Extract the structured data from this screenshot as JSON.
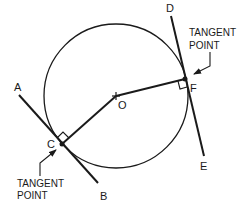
{
  "diagram": {
    "colors": {
      "stroke": "#1a1a1a",
      "background": "#ffffff"
    },
    "circle": {
      "center_label": "O",
      "cx": 116,
      "cy": 96,
      "r": 72
    },
    "points": {
      "O": {
        "label": "O",
        "x": 116,
        "y": 96
      },
      "C": {
        "label": "C",
        "x": 62,
        "y": 144
      },
      "F": {
        "label": "F",
        "x": 185,
        "y": 79
      }
    },
    "lines": {
      "AB": {
        "start_label": "A",
        "end_label": "B"
      },
      "DE": {
        "start_label": "D",
        "end_label": "E"
      }
    },
    "callouts": {
      "upper": {
        "line1": "TANGENT",
        "line2": "POINT"
      },
      "lower": {
        "line1": "TANGENT",
        "line2": "POINT"
      }
    }
  }
}
